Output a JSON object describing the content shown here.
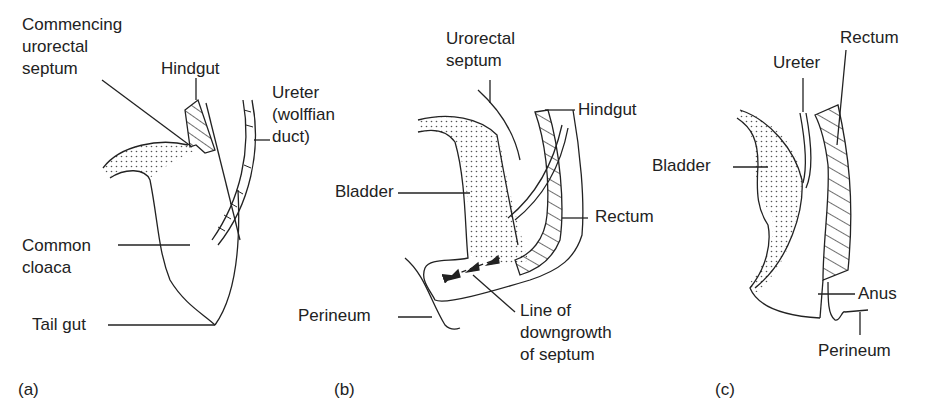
{
  "figure": {
    "panels": [
      {
        "id": "a",
        "panel_label": "(a)",
        "labels": {
          "urorectal_septum": "Commencing\nurorectal\nseptum",
          "hindgut": "Hindgut",
          "ureter": "Ureter\n(wolffian\nduct)",
          "cloaca": "Common\ncloaca",
          "tail_gut": "Tail gut"
        }
      },
      {
        "id": "b",
        "panel_label": "(b)",
        "labels": {
          "urorectal_septum": "Urorectal\nseptum",
          "hindgut": "Hindgut",
          "bladder": "Bladder",
          "rectum": "Rectum",
          "perineum": "Perineum",
          "downgrowth": "Line of\ndowngrowth\nof septum"
        }
      },
      {
        "id": "c",
        "panel_label": "(c)",
        "labels": {
          "ureter": "Ureter",
          "rectum": "Rectum",
          "bladder": "Bladder",
          "anus": "Anus",
          "perineum": "Perineum"
        }
      }
    ],
    "colors": {
      "ink": "#222222",
      "background": "#ffffff"
    }
  }
}
